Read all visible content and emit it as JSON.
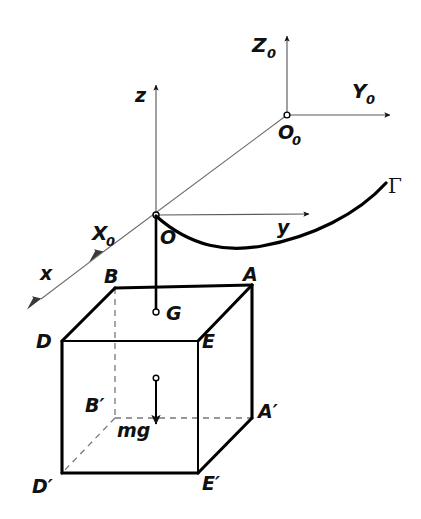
{
  "figure": {
    "background_color": "#ffffff",
    "ink_color": "#000000",
    "thin_line_color": "#5b5b5b",
    "dashed_line_color": "#777777"
  },
  "inertial_frame": {
    "origin_label": "O",
    "origin_subscript": "0",
    "axes": [
      {
        "label": "Z",
        "subscript": "0",
        "direction": "up"
      },
      {
        "label": "Y",
        "subscript": "0",
        "direction": "right"
      },
      {
        "label": "X",
        "subscript": "0",
        "direction": "down-left"
      }
    ]
  },
  "body_frame": {
    "origin_label": "O",
    "axes": [
      {
        "label": "z",
        "direction": "up"
      },
      {
        "label": "y",
        "direction": "right"
      },
      {
        "label": "x",
        "direction": "down-left"
      }
    ]
  },
  "curve": {
    "label": "Γ"
  },
  "body": {
    "center_of_mass_label": "G",
    "weight_label": "mg",
    "vertices": [
      {
        "label": "A",
        "hidden": false
      },
      {
        "label": "B",
        "hidden": false
      },
      {
        "label": "D",
        "hidden": false
      },
      {
        "label": "E",
        "hidden": false
      },
      {
        "label": "A′",
        "hidden": false
      },
      {
        "label": "B′",
        "hidden": true
      },
      {
        "label": "D′",
        "hidden": false
      },
      {
        "label": "E′",
        "hidden": false
      }
    ]
  }
}
